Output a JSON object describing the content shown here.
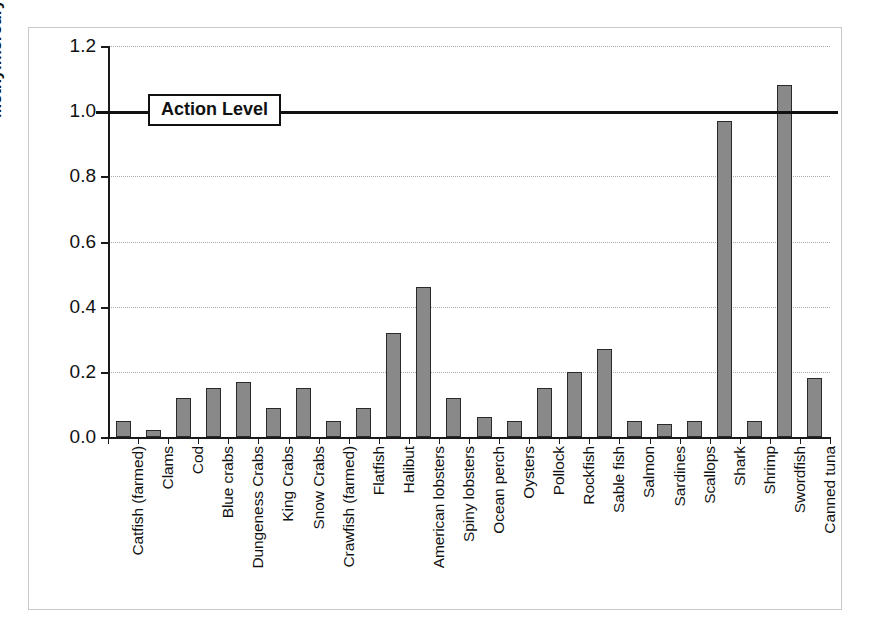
{
  "chart_data": {
    "type": "bar",
    "title": "",
    "xlabel": "",
    "ylabel": "Methylmercury (mg/kg)",
    "ylim": [
      0.0,
      1.2
    ],
    "ytick_labels": [
      "0.0",
      "0.2",
      "0.4",
      "0.6",
      "0.8",
      "1.0",
      "1.2"
    ],
    "ytick_values": [
      0.0,
      0.2,
      0.4,
      0.6,
      0.8,
      1.0,
      1.2
    ],
    "grid": "horizontal-dotted",
    "legend": "none",
    "bar_color": "#898989",
    "bar_edge_color": "#2a2a2a",
    "categories": [
      "Catfish (farmed)",
      "Clams",
      "Cod",
      "Blue crabs",
      "Dungeness Crabs",
      "King Crabs",
      "Snow Crabs",
      "Crawfish (farmed)",
      "Flatfish",
      "Halibut",
      "American lobsters",
      "Spiny lobsters",
      "Ocean perch",
      "Oysters",
      "Pollock",
      "Rockfish",
      "Sable fish",
      "Salmon",
      "Sardines",
      "Scallops",
      "Shark",
      "Shrimp",
      "Swordfish",
      "Canned tuna"
    ],
    "values": [
      0.05,
      0.02,
      0.12,
      0.15,
      0.17,
      0.09,
      0.15,
      0.05,
      0.09,
      0.32,
      0.46,
      0.12,
      0.06,
      0.05,
      0.15,
      0.2,
      0.27,
      0.05,
      0.04,
      0.05,
      0.97,
      0.05,
      1.08,
      0.18
    ],
    "annotations": [
      {
        "label": "Action Level",
        "value": 1.0,
        "type": "horizontal-reference-line",
        "line_color": "#111111"
      }
    ]
  }
}
